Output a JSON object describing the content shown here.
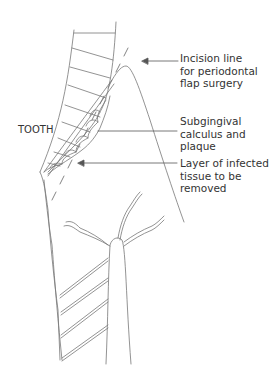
{
  "diagram": {
    "labels": {
      "tooth": "TOOTH",
      "incision": "Incision line\nfor periodontal\nflap surgery",
      "calculus": "Subgingival\ncalculus and\nplaque",
      "infected": "Layer of infected\ntissue to be\nremoved"
    },
    "colors": {
      "line": "#777777",
      "text": "#333333",
      "background": "#ffffff"
    }
  }
}
